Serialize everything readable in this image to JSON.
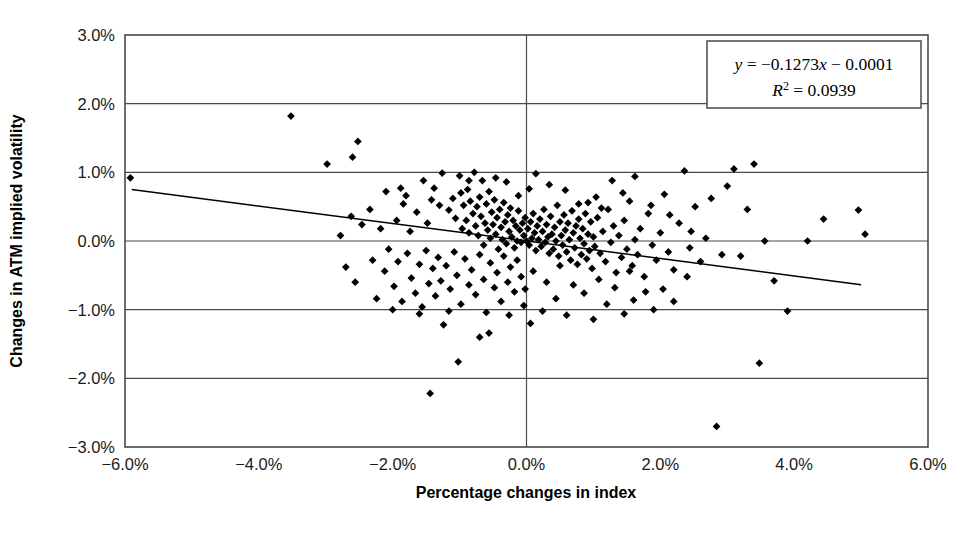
{
  "chart_data": {
    "type": "scatter",
    "title": "",
    "xlabel": "Percentage changes in index",
    "ylabel": "Changes in ATM implied volatility",
    "xlim": [
      -6.0,
      6.0
    ],
    "ylim": [
      -3.0,
      3.0
    ],
    "x_ticks": [
      -6.0,
      -4.0,
      -2.0,
      0.0,
      2.0,
      4.0,
      6.0
    ],
    "y_ticks": [
      -3.0,
      -2.0,
      -1.0,
      0.0,
      1.0,
      2.0,
      3.0
    ],
    "x_tick_labels": [
      "-6.0%",
      "-4.0%",
      "-2.0%",
      "0.0%",
      "2.0%",
      "4.0%",
      "6.0%"
    ],
    "y_tick_labels": [
      "-3.0%",
      "-2.0%",
      "-1.0%",
      "0.0%",
      "1.0%",
      "2.0%",
      "3.0%"
    ],
    "grid": true,
    "grid_axes": "both",
    "legend": "none",
    "marker": "diamond",
    "marker_color": "#000000",
    "marker_size": 6,
    "trendline": {
      "type": "linear",
      "slope": -0.1273,
      "intercept": -0.0001,
      "r_squared": 0.0939,
      "equation_label": "y = −0.1273x − 0.0001",
      "r2_label": "R² = 0.0939",
      "x_start": -5.9,
      "x_end": 5.0,
      "color": "#000000"
    },
    "points": [
      [
        -5.92,
        0.92
      ],
      [
        -3.52,
        1.82
      ],
      [
        -2.98,
        1.12
      ],
      [
        -2.52,
        1.45
      ],
      [
        -2.6,
        1.22
      ],
      [
        -1.88,
        0.77
      ],
      [
        -1.8,
        0.66
      ],
      [
        -1.42,
        0.6
      ],
      [
        -1.38,
        0.77
      ],
      [
        -1.3,
        0.52
      ],
      [
        -1.26,
        0.99
      ],
      [
        -1.16,
        0.45
      ],
      [
        -1.1,
        0.62
      ],
      [
        -1.06,
        0.33
      ],
      [
        -1.0,
        0.95
      ],
      [
        -0.98,
        0.7
      ],
      [
        -0.96,
        0.18
      ],
      [
        -0.94,
        0.52
      ],
      [
        -0.9,
        0.3
      ],
      [
        -0.88,
        0.75
      ],
      [
        -0.86,
        0.12
      ],
      [
        -0.84,
        0.58
      ],
      [
        -0.8,
        0.4
      ],
      [
        -0.78,
        1.0
      ],
      [
        -0.76,
        0.22
      ],
      [
        -0.74,
        0.5
      ],
      [
        -0.72,
        0.08
      ],
      [
        -0.7,
        0.64
      ],
      [
        -0.68,
        0.36
      ],
      [
        -0.66,
        0.88
      ],
      [
        -0.64,
        -0.06
      ],
      [
        -0.62,
        0.26
      ],
      [
        -0.6,
        0.54
      ],
      [
        -0.58,
        0.16
      ],
      [
        -0.56,
        0.72
      ],
      [
        -0.54,
        0.04
      ],
      [
        -0.52,
        0.42
      ],
      [
        -0.5,
        0.24
      ],
      [
        -0.48,
        0.6
      ],
      [
        -0.46,
        0.1
      ],
      [
        -0.44,
        0.34
      ],
      [
        -0.42,
        -0.12
      ],
      [
        -0.4,
        0.46
      ],
      [
        -0.38,
        0.2
      ],
      [
        -0.36,
        0.02
      ],
      [
        -0.34,
        0.56
      ],
      [
        -0.32,
        0.28
      ],
      [
        -0.3,
        -0.04
      ],
      [
        -0.28,
        0.38
      ],
      [
        -0.26,
        0.14
      ],
      [
        -0.24,
        0.48
      ],
      [
        -0.22,
        0.06
      ],
      [
        -0.2,
        0.3
      ],
      [
        -0.18,
        -0.1
      ],
      [
        -0.16,
        0.22
      ],
      [
        -0.14,
        0.0
      ],
      [
        -0.12,
        0.44
      ],
      [
        -0.1,
        0.16
      ],
      [
        -0.08,
        -0.02
      ],
      [
        -0.06,
        0.26
      ],
      [
        -0.04,
        0.08
      ],
      [
        -0.02,
        0.34
      ],
      [
        0.0,
        0.0
      ],
      [
        0.02,
        0.18
      ],
      [
        0.04,
        -0.06
      ],
      [
        0.06,
        0.28
      ],
      [
        0.08,
        0.04
      ],
      [
        0.1,
        0.4
      ],
      [
        0.12,
        0.12
      ],
      [
        0.14,
        -0.14
      ],
      [
        0.16,
        0.22
      ],
      [
        0.18,
        0.02
      ],
      [
        0.2,
        0.32
      ],
      [
        0.22,
        -0.08
      ],
      [
        0.24,
        0.14
      ],
      [
        0.26,
        0.46
      ],
      [
        0.28,
        -0.02
      ],
      [
        0.3,
        0.24
      ],
      [
        0.32,
        0.06
      ],
      [
        0.34,
        -0.18
      ],
      [
        0.36,
        0.36
      ],
      [
        0.38,
        0.1
      ],
      [
        0.4,
        -0.12
      ],
      [
        0.42,
        0.2
      ],
      [
        0.44,
        0.0
      ],
      [
        0.46,
        0.52
      ],
      [
        0.48,
        -0.22
      ],
      [
        0.5,
        0.28
      ],
      [
        0.52,
        0.08
      ],
      [
        0.54,
        -0.06
      ],
      [
        0.56,
        0.38
      ],
      [
        0.58,
        0.16
      ],
      [
        0.6,
        -0.16
      ],
      [
        0.62,
        0.26
      ],
      [
        0.64,
        0.02
      ],
      [
        0.66,
        -0.28
      ],
      [
        0.68,
        0.44
      ],
      [
        0.7,
        0.12
      ],
      [
        0.72,
        -0.1
      ],
      [
        0.74,
        0.22
      ],
      [
        0.76,
        -0.34
      ],
      [
        0.78,
        0.32
      ],
      [
        0.8,
        0.04
      ],
      [
        0.82,
        -0.2
      ],
      [
        0.84,
        0.18
      ],
      [
        0.86,
        -0.04
      ],
      [
        0.88,
        0.4
      ],
      [
        0.9,
        -0.26
      ],
      [
        0.92,
        0.1
      ],
      [
        0.94,
        -0.14
      ],
      [
        0.96,
        0.28
      ],
      [
        0.98,
        -0.4
      ],
      [
        1.0,
        0.06
      ],
      [
        1.02,
        -0.08
      ],
      [
        1.06,
        0.34
      ],
      [
        1.1,
        -0.18
      ],
      [
        1.14,
        0.14
      ],
      [
        1.18,
        -0.3
      ],
      [
        1.22,
        0.46
      ],
      [
        1.26,
        -0.02
      ],
      [
        1.3,
        0.22
      ],
      [
        1.34,
        -0.46
      ],
      [
        1.38,
        0.08
      ],
      [
        1.42,
        -0.24
      ],
      [
        1.46,
        0.3
      ],
      [
        1.5,
        -0.12
      ],
      [
        1.54,
        0.58
      ],
      [
        1.58,
        -0.36
      ],
      [
        1.62,
        0.02
      ],
      [
        1.66,
        -0.2
      ],
      [
        1.7,
        0.18
      ],
      [
        1.76,
        -0.52
      ],
      [
        1.82,
        0.4
      ],
      [
        1.88,
        -0.06
      ],
      [
        1.94,
        -0.28
      ],
      [
        2.0,
        0.12
      ],
      [
        2.06,
        0.68
      ],
      [
        2.12,
        -0.16
      ],
      [
        2.2,
        -0.42
      ],
      [
        2.28,
        0.26
      ],
      [
        2.36,
        1.02
      ],
      [
        2.44,
        -0.1
      ],
      [
        2.52,
        0.5
      ],
      [
        2.6,
        -0.3
      ],
      [
        2.68,
        0.04
      ],
      [
        2.76,
        0.62
      ],
      [
        2.84,
        -2.7
      ],
      [
        2.92,
        -0.2
      ],
      [
        3.0,
        0.8
      ],
      [
        3.1,
        1.05
      ],
      [
        3.2,
        -0.22
      ],
      [
        3.3,
        0.46
      ],
      [
        3.4,
        1.12
      ],
      [
        3.48,
        -1.78
      ],
      [
        3.56,
        0.0
      ],
      [
        3.7,
        -0.58
      ],
      [
        3.9,
        -1.02
      ],
      [
        4.2,
        0.0
      ],
      [
        4.44,
        0.32
      ],
      [
        4.96,
        0.45
      ],
      [
        5.06,
        0.1
      ],
      [
        -2.7,
        -0.38
      ],
      [
        -2.56,
        -0.6
      ],
      [
        -2.3,
        -0.28
      ],
      [
        -2.24,
        -0.84
      ],
      [
        -2.12,
        -0.44
      ],
      [
        -2.06,
        -0.12
      ],
      [
        -1.98,
        -0.66
      ],
      [
        -1.92,
        -0.3
      ],
      [
        -1.86,
        -0.88
      ],
      [
        -1.78,
        -0.18
      ],
      [
        -1.72,
        -0.54
      ],
      [
        -1.66,
        -0.76
      ],
      [
        -1.6,
        -0.34
      ],
      [
        -1.56,
        -0.96
      ],
      [
        -1.5,
        -0.14
      ],
      [
        -1.46,
        -0.62
      ],
      [
        -1.4,
        -0.4
      ],
      [
        -1.36,
        -0.8
      ],
      [
        -1.32,
        -0.24
      ],
      [
        -1.28,
        -0.58
      ],
      [
        -1.24,
        -1.22
      ],
      [
        -1.2,
        -0.36
      ],
      [
        -1.14,
        -0.7
      ],
      [
        -1.08,
        -0.16
      ],
      [
        -1.04,
        -0.5
      ],
      [
        -0.98,
        -0.92
      ],
      [
        -0.92,
        -0.26
      ],
      [
        -0.86,
        -0.64
      ],
      [
        -0.82,
        -0.42
      ],
      [
        -0.76,
        -0.78
      ],
      [
        -0.7,
        -0.2
      ],
      [
        -0.64,
        -0.56
      ],
      [
        -0.6,
        -1.04
      ],
      [
        -0.54,
        -0.32
      ],
      [
        -0.48,
        -0.68
      ],
      [
        -0.44,
        -0.46
      ],
      [
        -0.38,
        -0.88
      ],
      [
        -0.34,
        -0.22
      ],
      [
        -0.28,
        -0.6
      ],
      [
        -0.24,
        -0.38
      ],
      [
        -0.18,
        -0.74
      ],
      [
        -0.14,
        -0.28
      ],
      [
        -0.08,
        -0.52
      ],
      [
        -0.04,
        -0.94
      ],
      [
        -1.44,
        -2.22
      ],
      [
        -1.02,
        -1.76
      ],
      [
        -0.7,
        -1.4
      ],
      [
        -0.26,
        -1.08
      ],
      [
        0.06,
        -1.2
      ],
      [
        -2.46,
        0.24
      ],
      [
        -2.34,
        0.46
      ],
      [
        -2.18,
        0.18
      ],
      [
        -2.1,
        0.72
      ],
      [
        -1.94,
        0.3
      ],
      [
        -1.84,
        0.54
      ],
      [
        -1.74,
        0.14
      ],
      [
        -1.64,
        0.42
      ],
      [
        -1.54,
        0.88
      ],
      [
        -1.48,
        0.26
      ],
      [
        -2.78,
        0.08
      ],
      [
        -2.62,
        0.36
      ],
      [
        -0.12,
        0.66
      ],
      [
        0.04,
        0.76
      ],
      [
        0.34,
        0.82
      ],
      [
        0.58,
        0.74
      ],
      [
        0.78,
        0.54
      ],
      [
        1.04,
        0.64
      ],
      [
        1.28,
        0.88
      ],
      [
        1.62,
        0.94
      ],
      [
        -0.3,
        0.86
      ],
      [
        -0.46,
        0.92
      ],
      [
        0.14,
        0.98
      ],
      [
        -0.86,
        0.88
      ],
      [
        0.92,
        0.56
      ],
      [
        1.12,
        0.48
      ],
      [
        1.44,
        0.7
      ],
      [
        1.86,
        0.52
      ],
      [
        2.14,
        0.38
      ],
      [
        2.46,
        0.14
      ],
      [
        -0.56,
        -1.34
      ],
      [
        0.24,
        -1.02
      ],
      [
        0.6,
        -1.08
      ],
      [
        1.0,
        -1.14
      ],
      [
        1.46,
        -1.06
      ],
      [
        1.9,
        -1.0
      ],
      [
        -1.16,
        -1.02
      ],
      [
        -1.6,
        -1.06
      ],
      [
        -2.0,
        -1.0
      ],
      [
        0.44,
        -0.84
      ],
      [
        0.86,
        -0.76
      ],
      [
        1.2,
        -0.92
      ],
      [
        1.6,
        -0.86
      ],
      [
        2.04,
        -0.7
      ],
      [
        2.4,
        -0.52
      ],
      [
        -0.02,
        -0.7
      ],
      [
        0.1,
        -0.44
      ],
      [
        0.3,
        -0.6
      ],
      [
        0.5,
        -0.36
      ],
      [
        0.7,
        -0.64
      ],
      [
        1.08,
        -0.56
      ],
      [
        1.32,
        -0.68
      ],
      [
        1.54,
        -0.44
      ],
      [
        1.78,
        -0.74
      ],
      [
        2.2,
        -0.88
      ]
    ]
  },
  "axes": {
    "x_title": "Percentage changes in index",
    "y_title": "Changes in ATM implied volatility"
  },
  "equation_box": {
    "line1_lhs": "y",
    "line1_rhs": " = −0.1273",
    "line1_var": "x",
    "line1_tail": " − 0.0001",
    "line2_lhs": "R",
    "line2_sup": "2",
    "line2_rhs": " = 0.0939"
  }
}
